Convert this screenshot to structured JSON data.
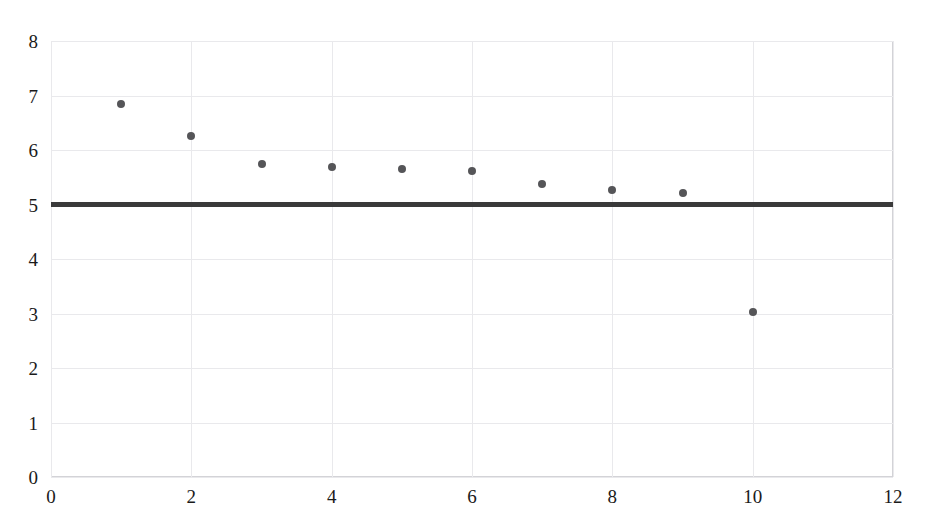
{
  "chart_data": {
    "type": "scatter",
    "title": "",
    "subtitle": "",
    "xlabel": "",
    "ylabel": "",
    "xlim": [
      0,
      12
    ],
    "ylim": [
      0,
      8
    ],
    "x_ticks": [
      0,
      2,
      4,
      6,
      8,
      10,
      12
    ],
    "y_ticks": [
      0,
      1,
      2,
      3,
      4,
      5,
      6,
      7,
      8
    ],
    "x_tick_labels": [
      "0",
      "2",
      "4",
      "6",
      "8",
      "10",
      "12"
    ],
    "y_tick_labels": [
      "0",
      "1",
      "2",
      "3",
      "4",
      "5",
      "6",
      "7",
      "8"
    ],
    "grid": true,
    "legend": false,
    "legend_position": "none",
    "series": [
      {
        "name": "observations",
        "marker": "circle",
        "color": "#555558",
        "x": [
          1,
          2,
          3,
          4,
          5,
          6,
          7,
          8,
          9,
          10
        ],
        "values": [
          6.85,
          6.25,
          5.75,
          5.68,
          5.66,
          5.62,
          5.37,
          5.26,
          5.21,
          3.02
        ]
      }
    ],
    "reference_lines": [
      {
        "name": "horizontal-reference",
        "orientation": "horizontal",
        "value": 5,
        "color": "#3a3a3a",
        "width_px": 5
      }
    ],
    "colors": {
      "background": "#ffffff",
      "grid": "#e9e9ec",
      "frame": "#d3d3d7",
      "marker": "#555558",
      "reference": "#3a3a3a",
      "text": "#1a1a1a"
    }
  }
}
